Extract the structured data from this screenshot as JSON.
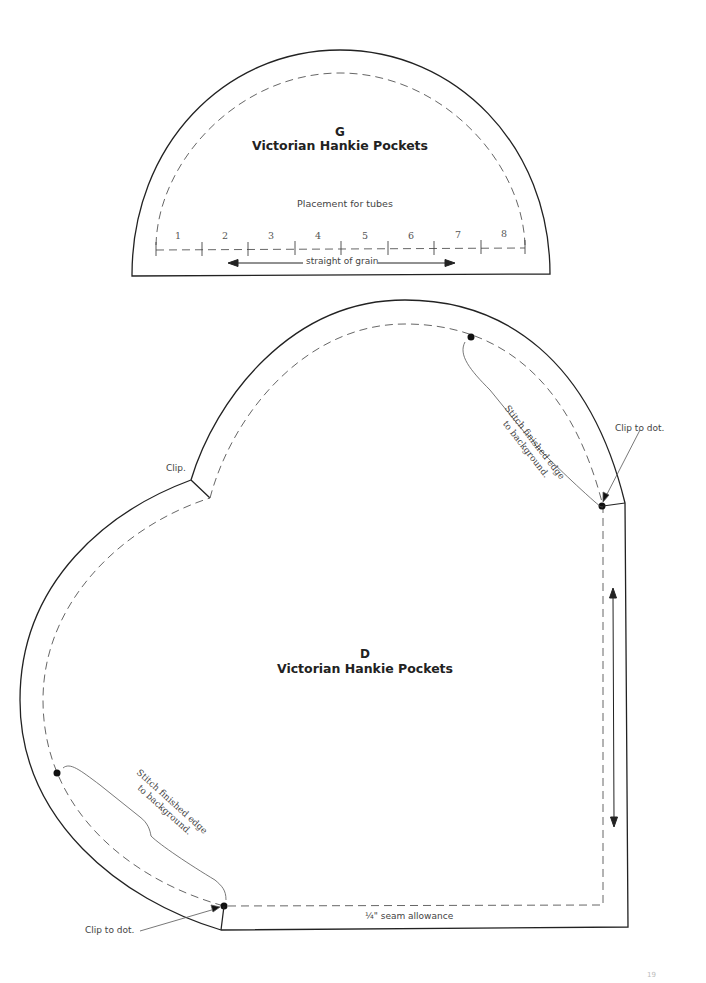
{
  "piece_g": {
    "letter": "G",
    "title": "Victorian Hankie Pockets",
    "placement_label": "Placement for tubes",
    "tube_numbers": [
      "1",
      "2",
      "3",
      "4",
      "5",
      "6",
      "7",
      "8"
    ],
    "grain_label": "straight of grain"
  },
  "piece_d": {
    "letter": "D",
    "title": "Victorian Hankie Pockets",
    "clip_label": "Clip.",
    "clip_to_dot_top": "Clip to dot.",
    "clip_to_dot_bottom": "Clip to dot.",
    "stitch_note_top": {
      "line1": "Stitch finished edge",
      "line2": "to background."
    },
    "stitch_note_bottom": {
      "line1": "Stitch finished edge",
      "line2": "to background."
    },
    "seam_allowance_label": "¼\" seam allowance"
  },
  "colors": {
    "outline": "#222222",
    "dashed": "#555555",
    "leader": "#555555"
  },
  "page_number": "19"
}
